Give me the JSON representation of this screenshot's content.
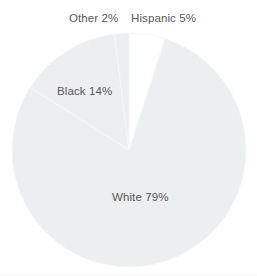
{
  "chart_data": {
    "type": "pie",
    "title": "",
    "subtitle": "",
    "xlabel": "",
    "ylabel": "",
    "legend_position": "none",
    "grid": false,
    "center": {
      "cx": 129,
      "cy": 150,
      "r": 117
    },
    "start_angle_deg": -90,
    "direction": "clockwise",
    "categories": [
      "Hispanic",
      "White",
      "Black",
      "Other"
    ],
    "values": [
      5,
      79,
      14,
      2
    ],
    "units": "percent",
    "slices": [
      {
        "name": "Hispanic",
        "value": 5,
        "label": "Hispanic 5%",
        "color": "#ffffff",
        "label_placement": "outside-top",
        "start_deg": -90,
        "end_deg": -72
      },
      {
        "name": "White",
        "value": 79,
        "label": "White 79%",
        "color": "#eceeef",
        "label_placement": "inside",
        "start_deg": -72,
        "end_deg": 212.4
      },
      {
        "name": "Black",
        "value": 14,
        "label": "Black 14%",
        "color": "#eceeef",
        "label_placement": "inside",
        "start_deg": 212.4,
        "end_deg": 262.8
      },
      {
        "name": "Other",
        "value": 2,
        "label": "Other 2%",
        "color": "#eceeef",
        "label_placement": "outside-top",
        "start_deg": 262.8,
        "end_deg": 270
      }
    ],
    "separator_color": "#f7f8f8",
    "label_text_color": "#58595b",
    "background_color": "#ffffff"
  },
  "labels": {
    "other": "Other 2%",
    "hispanic": "Hispanic 5%",
    "black": "Black 14%",
    "white": "White 79%"
  }
}
